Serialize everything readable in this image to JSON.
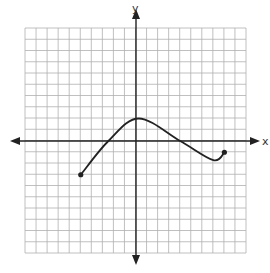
{
  "chart_data": {
    "type": "line",
    "title": "",
    "xlabel": "x",
    "ylabel": "y",
    "xlim": [
      -10,
      10
    ],
    "ylim": [
      -10,
      10
    ],
    "grid": true,
    "grid_step": 1,
    "tick_labels": false,
    "series": [
      {
        "name": "f(x)",
        "points": [
          {
            "x": -5,
            "y": -3,
            "endpoint": "closed"
          },
          {
            "x": -2.5,
            "y": 0
          },
          {
            "x": 0.25,
            "y": 2
          },
          {
            "x": 4,
            "y": 0
          },
          {
            "x": 7,
            "y": -1.7
          },
          {
            "x": 8,
            "y": -1,
            "endpoint": "closed"
          }
        ]
      }
    ],
    "annotations": [
      "closed dot at (-5, -3)",
      "closed dot at (8, -1)"
    ]
  },
  "axes": {
    "x_label": "x",
    "y_label": "y"
  },
  "colors": {
    "grid": "#b0b0b0",
    "axis": "#222222",
    "curve": "#222222",
    "background": "#ffffff"
  }
}
